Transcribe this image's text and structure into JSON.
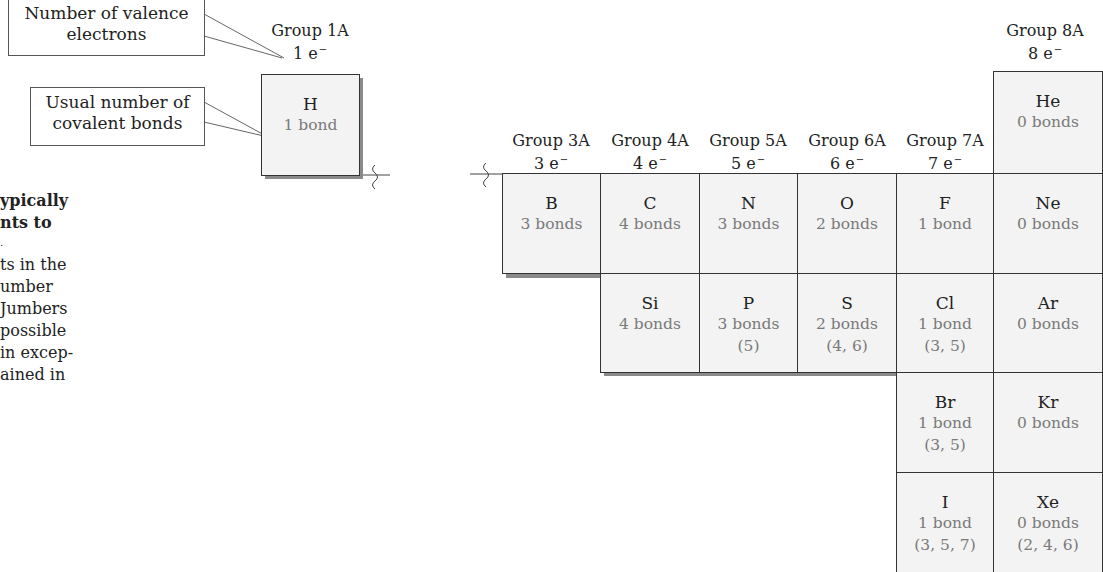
{
  "callouts": {
    "valence": {
      "line1": "Number of valence",
      "line2": "electrons"
    },
    "bonds": {
      "line1": "Usual number of",
      "line2": "covalent bonds"
    }
  },
  "side_text": {
    "lines": [
      {
        "text": "ypically",
        "bold": true
      },
      {
        "text": "nts to",
        "bold": true
      },
      {
        "text": ".",
        "bold": false
      },
      {
        "text": "ts in the",
        "bold": false
      },
      {
        "text": "umber",
        "bold": false
      },
      {
        "text": "Jumbers",
        "bold": false
      },
      {
        "text": "possible",
        "bold": false
      },
      {
        "text": "in excep-",
        "bold": false
      },
      {
        "text": "ained in",
        "bold": false
      }
    ]
  },
  "groups": [
    {
      "id": "1A",
      "label": "Group 1A",
      "electrons": "1 e",
      "charge": "−"
    },
    {
      "id": "3A",
      "label": "Group 3A",
      "electrons": "3 e",
      "charge": "−"
    },
    {
      "id": "4A",
      "label": "Group 4A",
      "electrons": "4 e",
      "charge": "−"
    },
    {
      "id": "5A",
      "label": "Group 5A",
      "electrons": "5 e",
      "charge": "−"
    },
    {
      "id": "6A",
      "label": "Group 6A",
      "electrons": "6 e",
      "charge": "−"
    },
    {
      "id": "7A",
      "label": "Group 7A",
      "electrons": "7 e",
      "charge": "−"
    },
    {
      "id": "8A",
      "label": "Group 8A",
      "electrons": "8 e",
      "charge": "−"
    }
  ],
  "elements": {
    "H": {
      "symbol": "H",
      "bonds": "1 bond",
      "alt": ""
    },
    "He": {
      "symbol": "He",
      "bonds": "0 bonds",
      "alt": ""
    },
    "B": {
      "symbol": "B",
      "bonds": "3 bonds",
      "alt": ""
    },
    "C": {
      "symbol": "C",
      "bonds": "4 bonds",
      "alt": ""
    },
    "N": {
      "symbol": "N",
      "bonds": "3 bonds",
      "alt": ""
    },
    "O": {
      "symbol": "O",
      "bonds": "2 bonds",
      "alt": ""
    },
    "F": {
      "symbol": "F",
      "bonds": "1 bond",
      "alt": ""
    },
    "Ne": {
      "symbol": "Ne",
      "bonds": "0 bonds",
      "alt": ""
    },
    "Si": {
      "symbol": "Si",
      "bonds": "4 bonds",
      "alt": ""
    },
    "P": {
      "symbol": "P",
      "bonds": "3 bonds",
      "alt": "(5)"
    },
    "S": {
      "symbol": "S",
      "bonds": "2 bonds",
      "alt": "(4, 6)"
    },
    "Cl": {
      "symbol": "Cl",
      "bonds": "1 bond",
      "alt": "(3, 5)"
    },
    "Ar": {
      "symbol": "Ar",
      "bonds": "0 bonds",
      "alt": ""
    },
    "Br": {
      "symbol": "Br",
      "bonds": "1 bond",
      "alt": "(3, 5)"
    },
    "Kr": {
      "symbol": "Kr",
      "bonds": "0 bonds",
      "alt": ""
    },
    "I": {
      "symbol": "I",
      "bonds": "1 bond",
      "alt": "(3, 5, 7)"
    },
    "Xe": {
      "symbol": "Xe",
      "bonds": "0 bonds",
      "alt": "(2, 4, 6)"
    }
  },
  "colors": {
    "cell_bg": "#f3f3f3",
    "cell_border": "#333333",
    "bond_text": "#7a7a7a",
    "shadow": "#8a8a8a"
  }
}
